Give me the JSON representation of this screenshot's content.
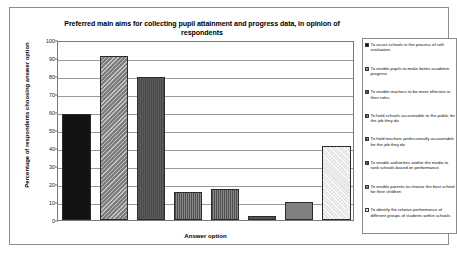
{
  "chart_data": {
    "type": "bar",
    "title": "Preferred main aims for collecting pupil attainment and progress data, in opinion of respondents",
    "xlabel": "Answer option",
    "ylabel": "Percentage of respondents choosing answer option",
    "ylim": [
      0,
      100
    ],
    "yticks": [
      0,
      10,
      20,
      30,
      40,
      50,
      60,
      70,
      80,
      90,
      100
    ],
    "grid": true,
    "legend_position": "right",
    "categories": [
      "To assist schools in the process of self-evaluation",
      "To enable pupils to make better academic progress",
      "To enable teachers to be more effective in their roles",
      "To hold schools accountable to the public for the job they do",
      "To hold teachers professionally accountable for the job they do",
      "To enable authorities and/or the media to rank schools based on performance",
      "To enable parents to choose the best school for their children",
      "To identify the relative performance of different groups of students within schools"
    ],
    "values": [
      59,
      91,
      79.5,
      15.5,
      17,
      2.5,
      10,
      41
    ],
    "series": [
      {
        "name": "Percentage of respondents choosing answer option",
        "values": [
          59,
          91,
          79.5,
          15.5,
          17,
          2.5,
          10,
          41
        ]
      }
    ],
    "bar_styles": [
      "fill-solid-black",
      "fill-diag-grey",
      "fill-dark-grey",
      "fill-vline-grey",
      "fill-vline-grey",
      "fill-dark-grey",
      "fill-mid-grey",
      "fill-light-dot"
    ]
  },
  "legend": {
    "items": [
      {
        "label": "To assist schools in the process of self-evaluation",
        "style": "fill-solid-black"
      },
      {
        "label": "To enable pupils to make better academic progress",
        "style": "fill-diag-grey"
      },
      {
        "label": "To enable teachers to be more effective in their roles",
        "style": "fill-dark-grey"
      },
      {
        "label": "To hold schools accountable to the public for the job they do",
        "style": "fill-vline-grey"
      },
      {
        "label": "To hold teachers professionally accountable for the job they do",
        "style": "fill-vline-grey"
      },
      {
        "label": "To enable authorities and/or the media to rank schools based on performance",
        "style": "fill-dark-grey"
      },
      {
        "label": "To enable parents to choose the best school for their children",
        "style": "fill-mid-grey"
      },
      {
        "label": "To identify the relative performance of different groups of students within schools",
        "style": "fill-light-dot"
      }
    ]
  },
  "colors": {
    "frame_border": "#8c8c8c",
    "plot_border": "#7a7a7a",
    "gridline": "#9a9a9a",
    "text": "#000000",
    "background": "#ffffff"
  }
}
